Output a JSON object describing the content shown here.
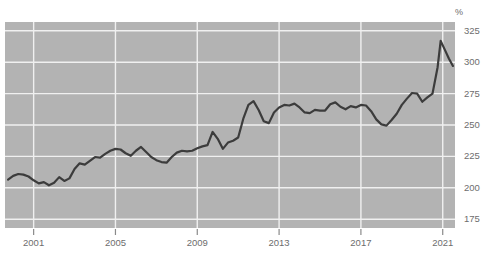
{
  "chart_data": {
    "type": "line",
    "title": "",
    "subtitle": "",
    "xlabel": "",
    "ylabel": "%",
    "unit_label": "%",
    "grid": true,
    "legend": null,
    "xlim": [
      1999.6,
      2021.6
    ],
    "ylim": [
      168,
      332
    ],
    "y_ticks": [
      175,
      200,
      225,
      250,
      275,
      300,
      325
    ],
    "y_tick_labels": [
      "175",
      "200",
      "225",
      "250",
      "275",
      "300",
      "325"
    ],
    "x_ticks": [
      2001,
      2005,
      2009,
      2013,
      2017,
      2021
    ],
    "x_tick_labels": [
      "2001",
      "2005",
      "2009",
      "2013",
      "2017",
      "2021"
    ],
    "colors": {
      "plot_background": "#b3b3b3",
      "grid": "#f0f0f0",
      "line": "#3c3c3c",
      "tick_text": "#6d6d6d",
      "page_background": "#ffffff"
    },
    "series": [
      {
        "name": "ratio",
        "x": [
          1999.75,
          2000.0,
          2000.25,
          2000.5,
          2000.75,
          2001.0,
          2001.25,
          2001.5,
          2001.75,
          2002.0,
          2002.25,
          2002.5,
          2002.75,
          2003.0,
          2003.25,
          2003.5,
          2003.75,
          2004.0,
          2004.25,
          2004.5,
          2004.75,
          2005.0,
          2005.25,
          2005.5,
          2005.75,
          2006.0,
          2006.25,
          2006.5,
          2006.75,
          2007.0,
          2007.25,
          2007.5,
          2007.75,
          2008.0,
          2008.25,
          2008.5,
          2008.75,
          2009.0,
          2009.25,
          2009.5,
          2009.75,
          2010.0,
          2010.25,
          2010.5,
          2010.75,
          2011.0,
          2011.25,
          2011.5,
          2011.75,
          2012.0,
          2012.25,
          2012.5,
          2012.75,
          2013.0,
          2013.25,
          2013.5,
          2013.75,
          2014.0,
          2014.25,
          2014.5,
          2014.75,
          2015.0,
          2015.25,
          2015.5,
          2015.75,
          2016.0,
          2016.25,
          2016.5,
          2016.75,
          2017.0,
          2017.25,
          2017.5,
          2017.75,
          2018.0,
          2018.25,
          2018.5,
          2018.75,
          2019.0,
          2019.25,
          2019.5,
          2019.75,
          2020.0,
          2020.25,
          2020.5,
          2020.75,
          2021.0,
          2021.25,
          2021.5
        ],
        "values": [
          206.5,
          209.5,
          211.0,
          210.5,
          209.0,
          206.0,
          203.5,
          204.5,
          202.0,
          204.0,
          208.5,
          205.5,
          207.5,
          215.0,
          219.5,
          218.5,
          221.5,
          224.5,
          224.0,
          227.0,
          229.5,
          231.0,
          230.5,
          227.5,
          225.5,
          229.5,
          232.5,
          228.5,
          224.5,
          222.0,
          220.5,
          220.0,
          224.5,
          228.0,
          229.5,
          229.0,
          229.5,
          231.5,
          233.0,
          234.0,
          244.5,
          239.0,
          231.0,
          236.0,
          237.5,
          240.0,
          255.0,
          266.0,
          269.0,
          262.0,
          253.0,
          251.5,
          260.0,
          264.0,
          266.0,
          265.5,
          267.0,
          264.0,
          260.0,
          259.5,
          262.0,
          261.5,
          261.5,
          266.5,
          268.0,
          264.5,
          262.5,
          265.0,
          264.0,
          266.0,
          265.5,
          261.0,
          254.5,
          250.5,
          249.5,
          254.0,
          259.0,
          266.0,
          271.0,
          275.5,
          275.0,
          268.0,
          261.0,
          265.5,
          272.0,
          272.5,
          270.0,
          268.5
        ]
      }
    ],
    "annotations": [
      {
        "label": "2020 COVID spike peak",
        "approx_value": 317,
        "approx_x": 2020.9
      }
    ]
  },
  "chart_extra": {
    "peak_2020": {
      "x": 2020.9,
      "value": 317.0
    },
    "end_point": {
      "x": 2021.5,
      "value": 297.0
    },
    "rise_points_x": [
      2020.0,
      2020.25,
      2020.5,
      2020.75,
      2020.9,
      2021.1,
      2021.3,
      2021.5
    ],
    "rise_points_y": [
      268.5,
      272.0,
      275.0,
      296.0,
      317.0,
      310.0,
      303.0,
      297.0
    ]
  }
}
